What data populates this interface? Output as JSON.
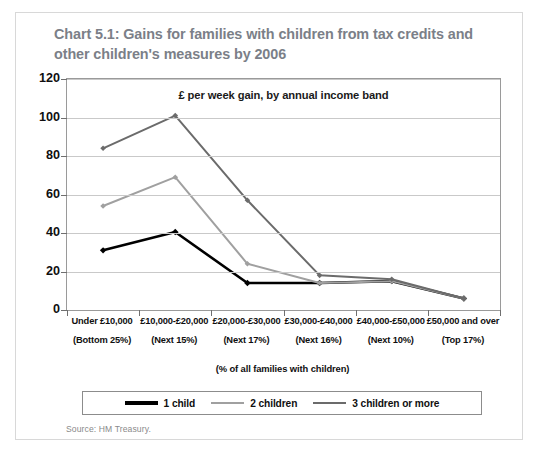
{
  "title": "Chart 5.1: Gains for families with children from tax credits and other children's measures by 2006",
  "source": "Source: HM Treasury.",
  "legend": {
    "items": [
      {
        "label": "1 child",
        "color": "#000000"
      },
      {
        "label": "2 children",
        "color": "#a0a0a0"
      },
      {
        "label": "3 children or more",
        "color": "#6b6b6b"
      }
    ]
  },
  "chart_data": {
    "type": "line",
    "title": "Chart 5.1: Gains for families with children from tax credits and other children's measures by 2006",
    "subtitle": "£ per week gain, by annual income band",
    "xlabel": "(% of all families with children)",
    "ylabel": "",
    "ylim": [
      0,
      120
    ],
    "yticks": [
      0,
      20,
      40,
      60,
      80,
      100,
      120
    ],
    "ytick_labels": [
      "0",
      "20",
      "40",
      "60",
      "80",
      "100",
      "120"
    ],
    "grid": true,
    "legend_position": "bottom",
    "categories": [
      "Under £10,000",
      "£10,000-£20,000",
      "£20,000-£30,000",
      "£30,000-£40,000",
      "£40,000-£50,000",
      "£50,000 and over"
    ],
    "category_sublabels": [
      "(Bottom 25%)",
      "(Next 15%)",
      "(Next 17%)",
      "(Next 16%)",
      "(Next 10%)",
      "(Top 17%)"
    ],
    "series": [
      {
        "name": "1 child",
        "color": "#000000",
        "values": [
          31,
          40.5,
          14,
          14,
          15,
          6
        ]
      },
      {
        "name": "2 children",
        "color": "#a0a0a0",
        "values": [
          54,
          69,
          24,
          14,
          15,
          6
        ]
      },
      {
        "name": "3 children or more",
        "color": "#6b6b6b",
        "values": [
          84,
          101,
          57,
          18,
          16,
          6
        ]
      }
    ]
  }
}
